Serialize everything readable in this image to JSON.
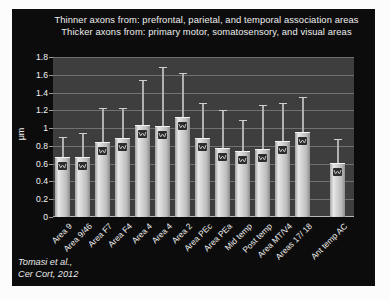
{
  "title": {
    "line1": "Thinner axons from: prefrontal, parietal, and temporal association areas",
    "line2": "Thicker axons from: primary motor, somatosensory, and visual areas"
  },
  "citation": {
    "line1": "Tomasi et al.,",
    "line2": "Cer Cort, 2012"
  },
  "chart_data": {
    "type": "bar",
    "title": "",
    "xlabel": "",
    "ylabel": "μm",
    "ylim": [
      0,
      1.8
    ],
    "ytick_step": 0.2,
    "ytick_labels": [
      "1.8",
      "1.6",
      "1.4",
      "1.2",
      "1",
      "0.8",
      "0.6",
      "0.4",
      "0.2",
      "0"
    ],
    "grid": true,
    "legend": "none",
    "categories": [
      "Area 9",
      "Area 9/46",
      "Area F7",
      "Area F4",
      "Area 4",
      "Area 4",
      "Area 2",
      "Area PEc",
      "Area PEa",
      "Mid temp",
      "Post temp",
      "Area MT/V4",
      "Areas 17/ 18",
      "Ant temp AC"
    ],
    "values": [
      0.67,
      0.68,
      0.84,
      0.89,
      1.04,
      1.02,
      1.13,
      0.89,
      0.78,
      0.74,
      0.77,
      0.86,
      0.96,
      0.61
    ],
    "error_upper": [
      0.22,
      0.25,
      0.37,
      0.33,
      0.49,
      0.66,
      0.48,
      0.38,
      0.41,
      0.34,
      0.48,
      0.41,
      0.38,
      0.26
    ],
    "gap_before_last_category": true,
    "bar_marker": "dark-square-with-light-zigzag",
    "colors": {
      "slide_background": "#0c0c0c",
      "plot_background": "#3e3e3e",
      "gridline": "#7e7e7e",
      "bar_fill": "#cccccc",
      "error_bar": "#b0b0b0",
      "marker": "#2c2c2c",
      "text": "#f0f0f0",
      "page_background": "#fcfcfc"
    }
  }
}
